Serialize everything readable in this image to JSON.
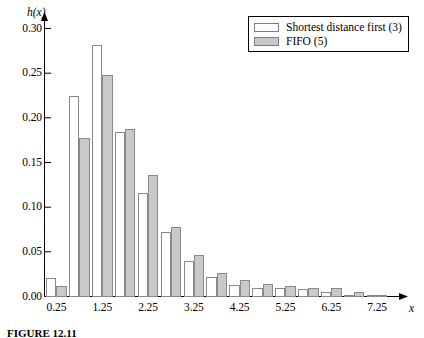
{
  "chart_data": {
    "type": "bar",
    "title": "",
    "subtitle": "",
    "xlabel": "x",
    "ylabel": "h(x)",
    "grid": false,
    "legend_position": "top-right",
    "xlim": [
      0.0,
      7.75
    ],
    "ylim": [
      0.0,
      0.315
    ],
    "ytick_labels": [
      "0.30",
      "0.25",
      "0.20",
      "0.15",
      "0.10",
      "0.05",
      "0.00"
    ],
    "ytick_values": [
      0.3,
      0.25,
      0.2,
      0.15,
      0.1,
      0.05,
      0.0
    ],
    "xtick_labels": [
      "0.25",
      "1.25",
      "2.25",
      "3.25",
      "4.25",
      "5.25",
      "6.25",
      "7.25"
    ],
    "xtick_values": [
      0.25,
      1.25,
      2.25,
      3.25,
      4.25,
      5.25,
      6.25,
      7.25
    ],
    "categories": [
      0.25,
      0.75,
      1.25,
      1.75,
      2.25,
      2.75,
      3.25,
      3.75,
      4.25,
      4.75,
      5.25,
      5.75,
      6.25,
      6.75,
      7.25
    ],
    "series": [
      {
        "name": "Shortest distance first (3)",
        "color": "#ffffff",
        "values": [
          0.021,
          0.224,
          0.281,
          0.184,
          0.116,
          0.072,
          0.04,
          0.022,
          0.013,
          0.009,
          0.009,
          0.008,
          0.005,
          0.002,
          0.001
        ]
      },
      {
        "name": "FIFO (5)",
        "color": "#c9c9c9",
        "values": [
          0.012,
          0.177,
          0.248,
          0.188,
          0.136,
          0.078,
          0.047,
          0.026,
          0.018,
          0.014,
          0.012,
          0.009,
          0.01,
          0.005,
          0.002
        ]
      }
    ]
  },
  "legend": {
    "entries": [
      {
        "label": "Shortest distance first (3)"
      },
      {
        "label": "FIFO (5)"
      }
    ]
  },
  "caption": {
    "text": "FIGURE 12.11"
  }
}
